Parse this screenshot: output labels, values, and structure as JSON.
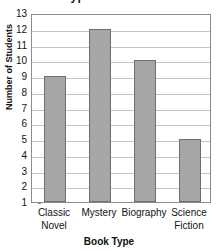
{
  "chart_data": {
    "type": "bar",
    "title": "Types of Books",
    "xlabel": "Book Type",
    "ylabel": "Number of Students",
    "categories": [
      "Classic Novel",
      "Mystery",
      "Biography",
      "Science Fiction"
    ],
    "values": [
      9,
      12,
      10,
      5
    ],
    "ylim": [
      1,
      13
    ],
    "y_ticks": [
      13,
      12,
      11,
      10,
      9,
      8,
      7,
      6,
      5,
      4,
      3,
      2,
      1
    ],
    "grid": true,
    "legend": false,
    "bar_color": "#a6a6a6",
    "bar_border_color": "#6e6e6e",
    "gridline_color": "#c4c4c4",
    "axis_color": "#8c8c8c"
  },
  "x_tick_lines": [
    [
      "Classic",
      "Novel"
    ],
    [
      "Mystery",
      ""
    ],
    [
      "Biography",
      ""
    ],
    [
      "Science",
      "Fiction"
    ]
  ]
}
